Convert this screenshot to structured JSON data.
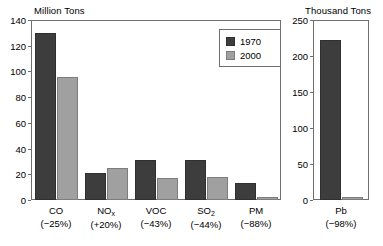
{
  "legend": {
    "entries": [
      {
        "label": "1970",
        "color": "#3d3d3d"
      },
      {
        "label": "2000",
        "color": "#a0a0a0"
      }
    ]
  },
  "chart_data": [
    {
      "type": "bar",
      "title": "",
      "ylabel": "Million Tons",
      "xlabel": "",
      "ylim": [
        0,
        140
      ],
      "yticks": [
        0,
        20,
        40,
        60,
        80,
        100,
        120,
        140
      ],
      "grid": false,
      "legend_position": "upper-right-inside",
      "categories": [
        "CO",
        "NOx",
        "VOC",
        "SO2",
        "PM"
      ],
      "category_labels": [
        "CO",
        "NO",
        "VOC",
        "SO",
        "PM"
      ],
      "category_subscripts": [
        "",
        "x",
        "",
        "2",
        ""
      ],
      "category_changes": [
        "(−25%)",
        "(+20%)",
        "(−43%)",
        "(−44%)",
        "(−88%)"
      ],
      "series": [
        {
          "name": "1970",
          "values": [
            130,
            21,
            31,
            31,
            13
          ]
        },
        {
          "name": "2000",
          "values": [
            96,
            25,
            17,
            18,
            2
          ]
        }
      ]
    },
    {
      "type": "bar",
      "title": "",
      "ylabel": "Thousand Tons",
      "xlabel": "",
      "ylim": [
        0,
        250
      ],
      "yticks": [
        0,
        50,
        100,
        150,
        200,
        250
      ],
      "grid": false,
      "categories": [
        "Pb"
      ],
      "category_labels": [
        "Pb"
      ],
      "category_subscripts": [
        ""
      ],
      "category_changes": [
        "(−98%)"
      ],
      "series": [
        {
          "name": "1970",
          "values": [
            222
          ]
        },
        {
          "name": "2000",
          "values": [
            4
          ]
        }
      ]
    }
  ]
}
